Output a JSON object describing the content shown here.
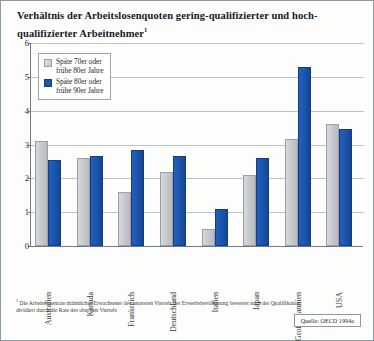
{
  "title": {
    "text": "Verhältnis der Arbeitslosenquoten gering-qualifizierter und hoch-qualifizierter Arbeitnehmer",
    "footnote_marker": "1"
  },
  "legend": {
    "items": [
      {
        "key": "old",
        "label": "Späte 70er oder\nfrühe 80er Jahre",
        "color": "#cfd3d7"
      },
      {
        "key": "new",
        "label": "Späte 80er oder\nfrühe 90er Jahre",
        "color": "#1a56ae"
      }
    ]
  },
  "footnote": {
    "marker": "1",
    "text": "Die Arbeitslosenrate männlicher Erwachsener des untersten Viertels der Erwerbsbevölkerung bewertet nach der Qualifikation dividiert durch die Rate des obersten Viertels"
  },
  "source": {
    "text": "Quelle: OECD 1994a"
  },
  "chart_data": {
    "type": "bar",
    "title": "Verhältnis der Arbeitslosenquoten gering-qualifizierter und hoch-qualifizierter Arbeitnehmer",
    "xlabel": "",
    "ylabel": "",
    "ylim": [
      0,
      6
    ],
    "yticks": [
      0,
      1,
      2,
      3,
      4,
      5,
      6
    ],
    "grid": true,
    "legend_position": "upper-left-inside",
    "categories": [
      "Australien",
      "Kanada",
      "Frankreich",
      "Deutschland",
      "Italien",
      "Japan",
      "Großbritannien",
      "USA"
    ],
    "series": [
      {
        "name": "Späte 70er oder frühe 80er Jahre",
        "color": "#cfd3d7",
        "values": [
          3.1,
          2.6,
          1.6,
          2.2,
          0.5,
          2.1,
          3.15,
          3.6
        ]
      },
      {
        "name": "Späte 80er oder frühe 90er Jahre",
        "color": "#1a56ae",
        "values": [
          2.55,
          2.65,
          2.85,
          2.65,
          1.1,
          2.6,
          5.3,
          3.45
        ]
      }
    ]
  }
}
